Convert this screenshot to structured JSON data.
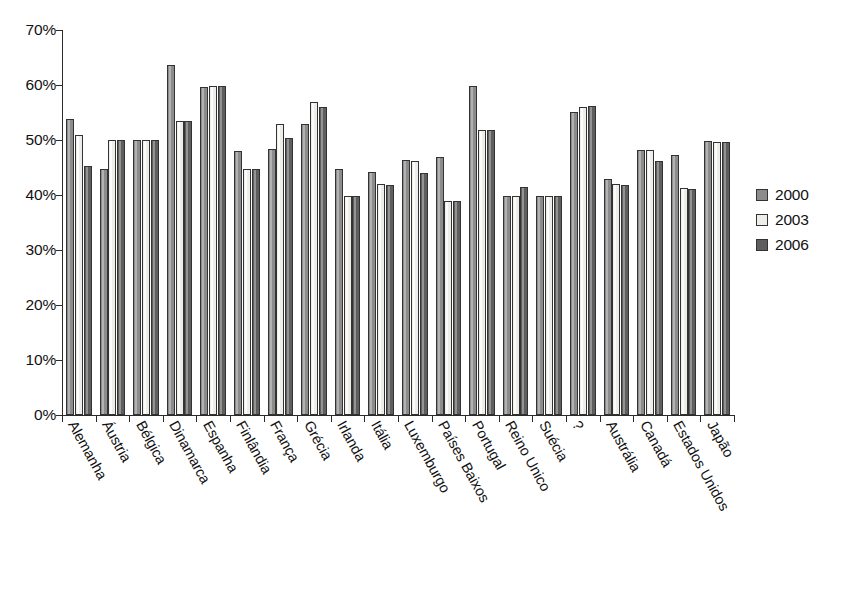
{
  "chart_data": {
    "type": "bar",
    "title": "",
    "subtitle": "",
    "xlabel": "",
    "ylabel": "",
    "ylim": [
      0,
      70
    ],
    "ytick_labels": [
      "70%",
      "60%",
      "50%",
      "40%",
      "30%",
      "20%",
      "10%",
      "0%"
    ],
    "ytick_values": [
      70,
      60,
      50,
      40,
      30,
      20,
      10,
      0
    ],
    "grid": false,
    "legend_position": "right",
    "value_suffix": "%",
    "categories": [
      "Alemanha",
      "Áustria",
      "Bélgica",
      "Dinamarca",
      "Espanha",
      "Finlândia",
      "França",
      "Grécia",
      "Irlanda",
      "Itália",
      "Luxemburgo",
      "Países Baixos",
      "Portugal",
      "Reino Unico",
      "Suécia",
      "?",
      "Austrália",
      "Canadá",
      "Estados Unidos",
      "Japão"
    ],
    "series": [
      {
        "name": "2000",
        "color": "#8c8c8c",
        "values": [
          53.8,
          44.8,
          50.0,
          63.7,
          59.6,
          48.0,
          48.4,
          53.0,
          44.8,
          44.2,
          46.3,
          47.0,
          59.9,
          39.8,
          39.8,
          55.1,
          43.0,
          48.1,
          47.2,
          49.8
        ]
      },
      {
        "name": "2003",
        "color": "#ededea",
        "values": [
          51.0,
          50.0,
          50.0,
          53.4,
          59.8,
          44.8,
          52.9,
          57.0,
          39.9,
          42.0,
          46.1,
          38.9,
          51.8,
          39.8,
          39.8,
          56.0,
          42.0,
          48.1,
          41.2,
          49.7
        ]
      },
      {
        "name": "2006",
        "color": "#5e5e5e",
        "values": [
          45.3,
          50.0,
          50.0,
          53.4,
          59.8,
          44.8,
          50.4,
          56.0,
          39.9,
          41.8,
          44.0,
          38.9,
          51.8,
          41.5,
          39.8,
          56.1,
          41.8,
          46.2,
          41.1,
          49.7
        ]
      }
    ]
  },
  "legend": {
    "entries": [
      {
        "label": "2000",
        "swatch": "#8c8c8c"
      },
      {
        "label": "2003",
        "swatch": "#ededea"
      },
      {
        "label": "2006",
        "swatch": "#5e5e5e"
      }
    ]
  }
}
